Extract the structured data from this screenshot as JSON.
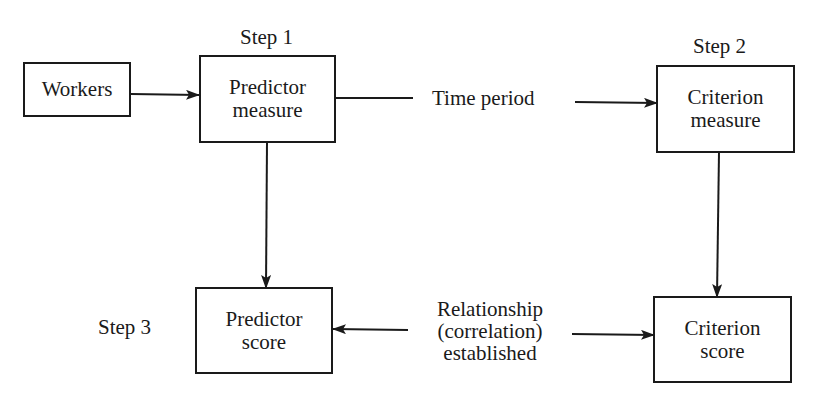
{
  "diagram": {
    "steps": {
      "step1": "Step 1",
      "step2": "Step 2",
      "step3": "Step 3"
    },
    "nodes": {
      "workers": {
        "lines": [
          "Workers"
        ]
      },
      "predictor_measure": {
        "lines": [
          "Predictor",
          "measure"
        ]
      },
      "criterion_measure": {
        "lines": [
          "Criterion",
          "measure"
        ]
      },
      "predictor_score": {
        "lines": [
          "Predictor",
          "score"
        ]
      },
      "criterion_score": {
        "lines": [
          "Criterion",
          "score"
        ]
      }
    },
    "edge_labels": {
      "time_period": "Time period",
      "relationship": [
        "Relationship",
        "(correlation)",
        "established"
      ]
    },
    "edges": [
      {
        "from": "Workers",
        "to": "Predictor measure"
      },
      {
        "from": "Predictor measure",
        "to": "Criterion measure",
        "label": "Time period"
      },
      {
        "from": "Predictor measure",
        "to": "Predictor score"
      },
      {
        "from": "Criterion measure",
        "to": "Criterion score"
      },
      {
        "from": "Relationship (correlation) established",
        "to": "Predictor score"
      },
      {
        "from": "Relationship (correlation) established",
        "to": "Criterion score"
      }
    ],
    "colors": {
      "stroke": "#1a1a1a",
      "background": "#ffffff"
    }
  }
}
